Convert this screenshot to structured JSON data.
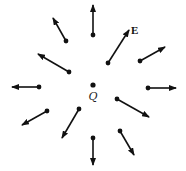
{
  "diagram": {
    "colors": {
      "arrow": "#111111",
      "background": "#ffffff"
    },
    "charge": {
      "label": "Q",
      "x": 93,
      "y": 85
    },
    "field_label": {
      "label": "E",
      "x": 131,
      "y": 34
    },
    "vectors": [
      {
        "id": "up",
        "x1": 93,
        "y1": 35,
        "x2": 93,
        "y2": 5
      },
      {
        "id": "upper-left",
        "x1": 66,
        "y1": 41,
        "x2": 53,
        "y2": 18
      },
      {
        "id": "left-upper",
        "x1": 69,
        "y1": 72,
        "x2": 38,
        "y2": 54
      },
      {
        "id": "left",
        "x1": 39,
        "y1": 87,
        "x2": 12,
        "y2": 87
      },
      {
        "id": "left-lower",
        "x1": 47,
        "y1": 111,
        "x2": 22,
        "y2": 125
      },
      {
        "id": "lower-left",
        "x1": 79,
        "y1": 109,
        "x2": 62,
        "y2": 138
      },
      {
        "id": "down",
        "x1": 93,
        "y1": 138,
        "x2": 93,
        "y2": 165
      },
      {
        "id": "lower-right",
        "x1": 120,
        "y1": 131,
        "x2": 134,
        "y2": 155
      },
      {
        "id": "right-lower",
        "x1": 117,
        "y1": 99,
        "x2": 149,
        "y2": 117
      },
      {
        "id": "right",
        "x1": 148,
        "y1": 88,
        "x2": 176,
        "y2": 88
      },
      {
        "id": "right-upper",
        "x1": 140,
        "y1": 61,
        "x2": 165,
        "y2": 47
      },
      {
        "id": "upper-right",
        "x1": 108,
        "y1": 63,
        "x2": 129,
        "y2": 30
      }
    ]
  }
}
